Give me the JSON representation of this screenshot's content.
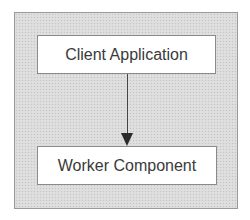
{
  "diagram": {
    "type": "flow",
    "direction": "top-to-bottom",
    "nodes": [
      {
        "id": "client",
        "label": "Client Application"
      },
      {
        "id": "worker",
        "label": "Worker Component"
      }
    ],
    "edges": [
      {
        "from": "client",
        "to": "worker",
        "arrow": "end"
      }
    ],
    "colors": {
      "panel_background": "#dcdcdc",
      "panel_border": "#9a9a9a",
      "box_background": "#ffffff",
      "box_border": "#8a8a8a",
      "text": "#3a3a3a",
      "arrow": "#2a2a2a"
    }
  }
}
